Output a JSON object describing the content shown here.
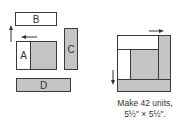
{
  "left_diagram": {
    "pieces": {
      "B": "B",
      "A": "A",
      "C": "C",
      "D": "D"
    }
  },
  "right_diagram": {
    "caption_line1": "Make 42 units,",
    "caption_line2": "5½\" × 5½\"."
  },
  "colors": {
    "fabric_light": "#ffffff",
    "fabric_gray": "#c4c4c4",
    "outline": "#3a3a3a"
  }
}
